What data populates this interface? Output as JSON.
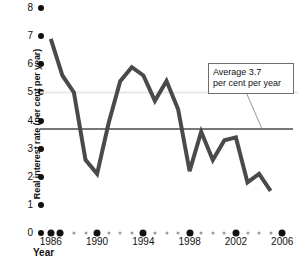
{
  "chart_data": {
    "type": "line",
    "title": "",
    "xlabel": "Year",
    "ylabel": "Real interest rate (per cent per year)",
    "xlim": [
      1985.5,
      2006.5
    ],
    "ylim": [
      0,
      8
    ],
    "grid": false,
    "legend_position": "none",
    "x": [
      1986,
      1987,
      1988,
      1989,
      1990,
      1991,
      1992,
      1993,
      1994,
      1995,
      1996,
      1997,
      1998,
      1999,
      2000,
      2001,
      2002,
      2003,
      2004,
      2005
    ],
    "values": [
      6.9,
      5.6,
      5.0,
      2.6,
      2.1,
      3.9,
      5.4,
      5.9,
      5.6,
      4.7,
      5.4,
      4.4,
      2.2,
      3.6,
      2.6,
      3.3,
      3.4,
      1.8,
      2.1,
      1.5
    ],
    "series": [
      {
        "name": "Real interest rate",
        "values": [
          6.9,
          5.6,
          5.0,
          2.6,
          2.1,
          3.9,
          5.4,
          5.9,
          5.6,
          4.7,
          5.4,
          4.4,
          2.2,
          3.6,
          2.6,
          3.3,
          3.4,
          1.8,
          2.1,
          1.5
        ]
      }
    ],
    "reference_lines": [
      {
        "name": "average",
        "value": 3.7,
        "label": "Average 3.7 per cent per year",
        "color": "#4a4a4a"
      },
      {
        "name": "upper-faint",
        "value": 5.0,
        "color": "#e2e2e2"
      }
    ],
    "y_ticks": [
      0,
      1,
      2,
      3,
      4,
      5,
      6,
      7,
      8
    ],
    "x_ticks_major": [
      1986,
      1990,
      1994,
      1998,
      2002,
      2006
    ],
    "x_ticks_minor": [
      1987,
      1988,
      1989,
      1991,
      1992,
      1993,
      1995,
      1996,
      1997,
      1999,
      2000,
      2001,
      2003,
      2004,
      2005
    ],
    "line_color": "#4a4a4a"
  },
  "axes": {
    "y_title": "Real interest rate (per cent per year)",
    "x_title": "Year",
    "y_tick_labels": [
      "0",
      "1",
      "2",
      "3",
      "4",
      "5",
      "6",
      "7",
      "8"
    ],
    "x_tick_labels": [
      "1986",
      "1990",
      "1994",
      "1998",
      "2002",
      "2006"
    ]
  },
  "annotation": {
    "line1": "Average 3.7",
    "line2": "per cent per year"
  }
}
